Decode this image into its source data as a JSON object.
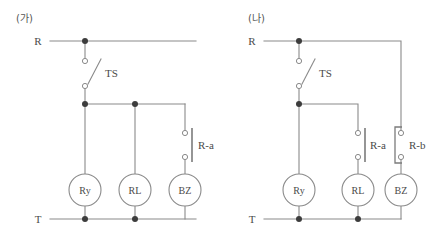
{
  "figure": {
    "type": "electrical-control-circuit-diagram",
    "panel_count": 2,
    "line_color": "#8a8a8a",
    "node_color": "#3c3c3c",
    "text_color": "#4a4a4a",
    "background": "#ffffff"
  },
  "panel_a": {
    "caption": "(가)",
    "rails": {
      "top_label": "R",
      "bottom_label": "T"
    },
    "switch": {
      "label": "TS",
      "kind": "knife-switch"
    },
    "contacts": [
      {
        "label": "R-a",
        "kind": "normally-open",
        "branch": "BZ"
      }
    ],
    "devices": [
      {
        "label": "Ry",
        "name": "relay"
      },
      {
        "label": "RL",
        "name": "red-lamp"
      },
      {
        "label": "BZ",
        "name": "buzzer"
      }
    ],
    "notes": "R rail runs across top; TS feeds a bus that supplies Ry, RL and (through R-a) BZ; all device bottoms return to T."
  },
  "panel_b": {
    "caption": "(나)",
    "rails": {
      "top_label": "R",
      "bottom_label": "T"
    },
    "switch": {
      "label": "TS",
      "kind": "knife-switch"
    },
    "contacts": [
      {
        "label": "R-a",
        "kind": "normally-open",
        "branch": "RL"
      },
      {
        "label": "R-b",
        "kind": "normally-closed",
        "branch": "BZ"
      }
    ],
    "devices": [
      {
        "label": "Ry",
        "name": "relay"
      },
      {
        "label": "RL",
        "name": "red-lamp"
      },
      {
        "label": "BZ",
        "name": "buzzer"
      }
    ],
    "notes": "TS feeds Ry directly and RL through R-a; BZ is fed from the R rail through R-b; all device bottoms return to T."
  }
}
